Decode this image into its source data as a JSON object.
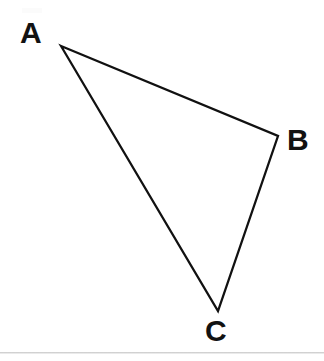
{
  "figure": {
    "background_color": "#ffffff",
    "stroke_color": "#111111",
    "label_color": "#121212",
    "width": 324,
    "height": 361,
    "footer_rule_color": "#c9c9c9"
  },
  "labels": {
    "a": "A",
    "b": "B",
    "c": "C"
  },
  "chart_data": {
    "type": "diagram",
    "shape": "triangle",
    "xlabel": "",
    "ylabel": "",
    "xlim": [
      0,
      324
    ],
    "ylim": [
      361,
      0
    ],
    "grid": false,
    "legend": "none",
    "stroke_width_px": 2.3,
    "vertices": [
      {
        "label": "A",
        "x": 61,
        "y": 46,
        "label_x": 30,
        "label_y": 31
      },
      {
        "label": "B",
        "x": 278,
        "y": 136,
        "label_x": 296,
        "label_y": 138
      },
      {
        "label": "C",
        "x": 218,
        "y": 311,
        "label_x": 215,
        "label_y": 330
      }
    ],
    "edges": [
      {
        "from": "A",
        "to": "B"
      },
      {
        "from": "B",
        "to": "C"
      },
      {
        "from": "C",
        "to": "A"
      }
    ],
    "polygon_points": "61,46 278,136 218,311",
    "annotations": []
  }
}
